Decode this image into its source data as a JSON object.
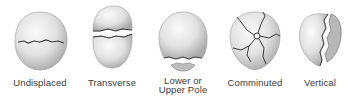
{
  "figure": {
    "fracture_types": [
      {
        "id": "undisplaced",
        "label_line1": "Undisplaced",
        "label_line2": ""
      },
      {
        "id": "transverse",
        "label_line1": "Transverse",
        "label_line2": ""
      },
      {
        "id": "lower-upper-pole",
        "label_line1": "Lower or",
        "label_line2": "Upper Pole"
      },
      {
        "id": "comminuted",
        "label_line1": "Comminuted",
        "label_line2": ""
      },
      {
        "id": "vertical",
        "label_line1": "Vertical",
        "label_line2": ""
      }
    ],
    "colors": {
      "bone_light": "#f2f2f2",
      "bone_mid": "#d6d6d6",
      "bone_dark": "#9a9a9a",
      "crack": "#3c3c3c",
      "label": "#3a3a3a"
    }
  }
}
